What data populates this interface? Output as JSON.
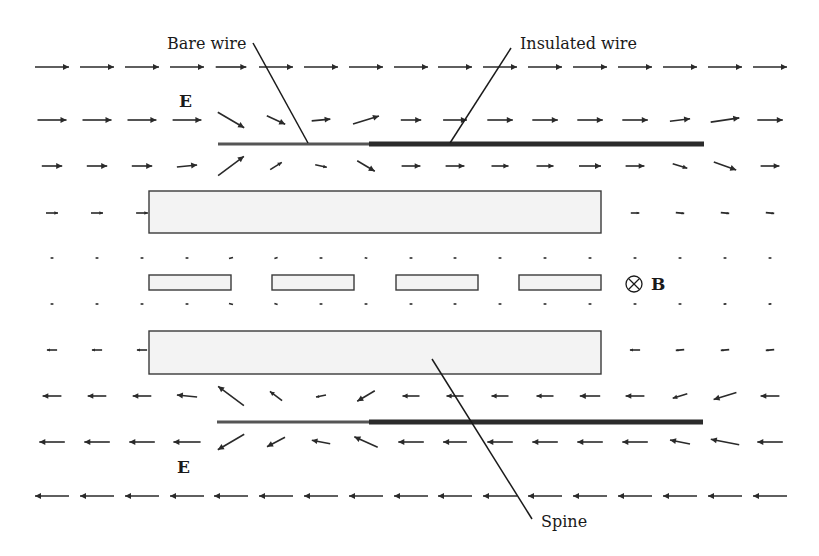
{
  "diagram": {
    "labels": {
      "bare_wire": "Bare wire",
      "insulated_wire": "Insulated wire",
      "field_E_top": "E",
      "field_E_bottom": "E",
      "field_B": "B",
      "spine": "Spine",
      "b_symbol": "⊗"
    },
    "colors": {
      "background": "#ffffff",
      "arrow": "#2a2a2a",
      "spine_fill": "#f3f3f3",
      "outline": "#3a3a3a"
    },
    "geometry": {
      "columns_x": [
        52,
        97,
        142,
        187,
        231,
        276,
        321,
        366,
        411,
        455,
        500,
        545,
        590,
        635,
        680,
        725,
        770
      ],
      "rows_y": [
        67,
        120,
        166,
        213,
        258,
        304,
        350,
        396,
        442,
        496
      ],
      "upper_spine": {
        "x": 149,
        "y": 191,
        "w": 452,
        "h": 42
      },
      "lower_spine": {
        "x": 149,
        "y": 331,
        "w": 452,
        "h": 43
      },
      "vertebrae": [
        {
          "x": 149,
          "y": 275,
          "w": 82,
          "h": 15
        },
        {
          "x": 272,
          "y": 275,
          "w": 82,
          "h": 15
        },
        {
          "x": 396,
          "y": 275,
          "w": 82,
          "h": 15
        },
        {
          "x": 519,
          "y": 275,
          "w": 82,
          "h": 15
        }
      ],
      "upper_wire": {
        "y": 144,
        "bare_x1": 218,
        "bare_x2": 369,
        "ins_x2": 704
      },
      "lower_wire": {
        "y": 422,
        "bare_x1": 217,
        "bare_x2": 369,
        "ins_x2": 703
      }
    },
    "field_rows": [
      {
        "y": 67,
        "vectors": [
          [
            1,
            0,
            1
          ],
          [
            1,
            0,
            1
          ],
          [
            1,
            0,
            1
          ],
          [
            1,
            0,
            1
          ],
          [
            1,
            0,
            0.9
          ],
          [
            1,
            0,
            1
          ],
          [
            1,
            0,
            1
          ],
          [
            1,
            0,
            1
          ],
          [
            1,
            0,
            1
          ],
          [
            1,
            0,
            1
          ],
          [
            1,
            0,
            1
          ],
          [
            1,
            0,
            1
          ],
          [
            1,
            0,
            1
          ],
          [
            1,
            0,
            1
          ],
          [
            1,
            0,
            1
          ],
          [
            1,
            0,
            1
          ],
          [
            1,
            0,
            1
          ]
        ]
      },
      {
        "y": 120,
        "vectors": [
          [
            1,
            0,
            0.85
          ],
          [
            1,
            0,
            0.85
          ],
          [
            1,
            0,
            0.85
          ],
          [
            1,
            0,
            0.85
          ],
          [
            0.85,
            0.5,
            0.9
          ],
          [
            0.85,
            0.4,
            0.6
          ],
          [
            1,
            -0.1,
            0.55
          ],
          [
            0.95,
            -0.3,
            0.8
          ],
          [
            1,
            0,
            0.6
          ],
          [
            1,
            0,
            0.7
          ],
          [
            1,
            0,
            0.75
          ],
          [
            1,
            0,
            0.75
          ],
          [
            1,
            0,
            0.75
          ],
          [
            1,
            0,
            0.75
          ],
          [
            1,
            -0.12,
            0.6
          ],
          [
            1,
            -0.15,
            0.85
          ],
          [
            1,
            0,
            0.75
          ]
        ]
      },
      {
        "y": 166,
        "vectors": [
          [
            1,
            0,
            0.6
          ],
          [
            1,
            0,
            0.6
          ],
          [
            1,
            0,
            0.6
          ],
          [
            1,
            -0.1,
            0.6
          ],
          [
            0.8,
            -0.6,
            0.95
          ],
          [
            0.8,
            -0.5,
            0.4
          ],
          [
            1,
            0.2,
            0.35
          ],
          [
            0.85,
            0.5,
            0.6
          ],
          [
            1,
            0,
            0.55
          ],
          [
            1,
            0,
            0.55
          ],
          [
            1,
            0,
            0.5
          ],
          [
            1,
            0,
            0.5
          ],
          [
            1,
            0,
            0.65
          ],
          [
            1,
            0,
            0.55
          ],
          [
            1,
            0.3,
            0.45
          ],
          [
            1,
            0.35,
            0.7
          ],
          [
            1,
            0,
            0.55
          ]
        ]
      },
      {
        "y": 213,
        "vectors": [
          [
            1,
            0,
            0.35
          ],
          [
            1,
            0,
            0.35
          ],
          [
            1,
            0,
            0.35
          ],
          [
            1,
            -0.2,
            0.35
          ],
          [
            1,
            -0.2,
            0.65
          ],
          [
            1,
            -0.3,
            0.3
          ],
          [
            1,
            0,
            0.25
          ],
          [
            1,
            0.1,
            0.25
          ],
          [
            1,
            0,
            0.25
          ],
          [
            1,
            0,
            0.25
          ],
          [
            1,
            0,
            0.45
          ],
          [
            1,
            0,
            0.25
          ],
          [
            1,
            0,
            0.25
          ],
          [
            1,
            0,
            0.25
          ],
          [
            1,
            0.1,
            0.25
          ],
          [
            1,
            0.1,
            0.25
          ],
          [
            1,
            0.1,
            0.25
          ]
        ]
      },
      {
        "y": 258,
        "vectors": [
          [
            1,
            0,
            0.08
          ],
          [
            1,
            0,
            0.08
          ],
          [
            1,
            0,
            0.08
          ],
          [
            1,
            0,
            0.08
          ],
          [
            1,
            -0.3,
            0.12
          ],
          [
            1,
            -0.3,
            0.1
          ],
          [
            1,
            0,
            0.08
          ],
          [
            1,
            0.2,
            0.08
          ],
          [
            1,
            0,
            0.08
          ],
          [
            1,
            0,
            0.08
          ],
          [
            1,
            0,
            0.08
          ],
          [
            1,
            0,
            0.08
          ],
          [
            1,
            0,
            0.08
          ],
          [
            1,
            0,
            0.08
          ],
          [
            1,
            0,
            0.08
          ],
          [
            1,
            0,
            0.08
          ],
          [
            1,
            0,
            0.08
          ]
        ]
      },
      {
        "y": 304,
        "vectors": [
          [
            -1,
            0,
            0.08
          ],
          [
            -1,
            0,
            0.08
          ],
          [
            -1,
            0,
            0.08
          ],
          [
            -1,
            0,
            0.08
          ],
          [
            -1,
            -0.3,
            0.12
          ],
          [
            -1,
            -0.3,
            0.1
          ],
          [
            -1,
            0,
            0.08
          ],
          [
            -1,
            0,
            0.08
          ],
          [
            -1,
            0,
            0.08
          ],
          [
            -1,
            0,
            0.08
          ],
          [
            -1,
            0,
            0.08
          ],
          [
            -1,
            0,
            0.08
          ],
          [
            -1,
            0,
            0.08
          ],
          [
            -1,
            0,
            0.08
          ],
          [
            -1,
            0,
            0.08
          ],
          [
            -1,
            0.1,
            0.08
          ],
          [
            -1,
            0.1,
            0.08
          ]
        ]
      },
      {
        "y": 350,
        "vectors": [
          [
            -1,
            0,
            0.3
          ],
          [
            -1,
            0,
            0.3
          ],
          [
            -1,
            0,
            0.3
          ],
          [
            -1,
            -0.2,
            0.3
          ],
          [
            -1,
            -0.25,
            0.65
          ],
          [
            -1,
            -0.35,
            0.3
          ],
          [
            -1,
            0,
            0.25
          ],
          [
            -1,
            0.1,
            0.25
          ],
          [
            -1,
            0,
            0.25
          ],
          [
            -1,
            0,
            0.25
          ],
          [
            -1,
            0,
            0.45
          ],
          [
            -1,
            0,
            0.25
          ],
          [
            -1,
            0,
            0.3
          ],
          [
            -1,
            0,
            0.3
          ],
          [
            -1,
            0.1,
            0.25
          ],
          [
            -1,
            0.1,
            0.25
          ],
          [
            -1,
            0.1,
            0.25
          ]
        ]
      },
      {
        "y": 396,
        "vectors": [
          [
            -1,
            0,
            0.55
          ],
          [
            -1,
            0,
            0.55
          ],
          [
            -1,
            0,
            0.55
          ],
          [
            -1,
            -0.1,
            0.6
          ],
          [
            -0.8,
            -0.6,
            0.95
          ],
          [
            -0.8,
            -0.6,
            0.45
          ],
          [
            -1,
            0.2,
            0.3
          ],
          [
            -0.85,
            0.5,
            0.6
          ],
          [
            -1,
            0,
            0.5
          ],
          [
            -1,
            0,
            0.5
          ],
          [
            -1,
            0,
            0.5
          ],
          [
            -1,
            0,
            0.5
          ],
          [
            -1,
            0,
            0.6
          ],
          [
            -1,
            0,
            0.55
          ],
          [
            -1,
            0.3,
            0.45
          ],
          [
            -1,
            0.3,
            0.7
          ],
          [
            -1,
            0,
            0.55
          ]
        ]
      },
      {
        "y": 442,
        "vectors": [
          [
            -1,
            0,
            0.75
          ],
          [
            -1,
            0,
            0.75
          ],
          [
            -1,
            0,
            0.75
          ],
          [
            -1,
            0,
            0.8
          ],
          [
            -0.85,
            0.5,
            0.9
          ],
          [
            -0.85,
            0.45,
            0.6
          ],
          [
            -1,
            -0.2,
            0.55
          ],
          [
            -0.9,
            -0.4,
            0.75
          ],
          [
            -1,
            0,
            0.75
          ],
          [
            -1,
            0,
            0.7
          ],
          [
            -1,
            0,
            0.75
          ],
          [
            -1,
            0,
            0.75
          ],
          [
            -1,
            0,
            0.75
          ],
          [
            -1,
            0,
            0.75
          ],
          [
            -1,
            -0.2,
            0.6
          ],
          [
            -1,
            -0.2,
            0.85
          ],
          [
            -1,
            0,
            0.75
          ]
        ]
      },
      {
        "y": 496,
        "vectors": [
          [
            -1,
            0,
            1
          ],
          [
            -1,
            0,
            1
          ],
          [
            -1,
            0,
            1
          ],
          [
            -1,
            0,
            1
          ],
          [
            -1,
            0,
            1
          ],
          [
            -1,
            0,
            1
          ],
          [
            -1,
            0,
            1
          ],
          [
            -1,
            0,
            1
          ],
          [
            -1,
            0,
            1
          ],
          [
            -1,
            0,
            1
          ],
          [
            -1,
            0,
            1
          ],
          [
            -1,
            0,
            1
          ],
          [
            -1,
            0,
            1
          ],
          [
            -1,
            0,
            1
          ],
          [
            -1,
            0,
            1
          ],
          [
            -1,
            0,
            1
          ],
          [
            -1,
            0,
            1
          ]
        ]
      }
    ]
  }
}
